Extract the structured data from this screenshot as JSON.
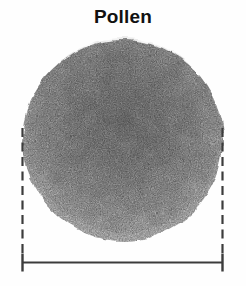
{
  "title": "Pollen",
  "figure": {
    "measurement": "diameter-bracket"
  },
  "colors": {
    "background": "#ffffff",
    "title_text": "#111111",
    "measurement_line": "#3c3c3c",
    "grain_core": "#878787",
    "grain_mid": "#999999",
    "grain_outer": "#b6b6b6",
    "grain_edge": "#d9d9d9",
    "grain_speckle": "#4a4a4a"
  }
}
